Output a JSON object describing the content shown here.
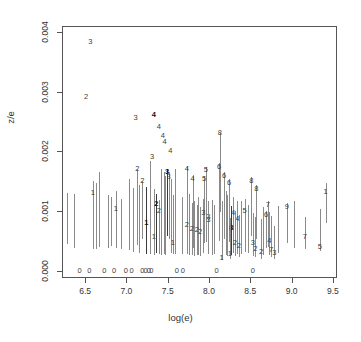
{
  "chart_data": {
    "type": "scatter",
    "title": "",
    "xlabel": "log(e)",
    "ylabel": "z/e",
    "xlim": [
      6.22,
      9.55
    ],
    "ylim": [
      -0.00012,
      0.0041
    ],
    "grid": false,
    "legend": null,
    "xticks": [
      "6.5",
      "7.0",
      "7.5",
      "8.0",
      "8.5",
      "9.0",
      "9.5"
    ],
    "xtick_values": [
      6.5,
      7.0,
      7.5,
      8.0,
      8.5,
      9.0,
      9.5
    ],
    "yticks": [
      "0.000",
      "0.001",
      "0.002",
      "0.003",
      "0.004"
    ],
    "ytick_values": [
      0.0,
      0.001,
      0.002,
      0.003,
      0.004
    ],
    "marker_style": "digit-label-with-vertical-errorbar",
    "points": [
      {
        "x": 6.55,
        "y": 0.00385,
        "label": "3",
        "bold": false,
        "err": null
      },
      {
        "x": 6.5,
        "y": 0.00292,
        "label": "2",
        "bold": false,
        "err": null
      },
      {
        "x": 7.1,
        "y": 0.00258,
        "label": "3",
        "bold": false,
        "err": null
      },
      {
        "x": 7.32,
        "y": 0.00262,
        "label": "4",
        "bold": true,
        "err": null
      },
      {
        "x": 7.38,
        "y": 0.00243,
        "label": "4",
        "bold": false,
        "err": null
      },
      {
        "x": 7.43,
        "y": 0.00228,
        "label": "4",
        "bold": false,
        "err": null
      },
      {
        "x": 7.45,
        "y": 0.00218,
        "label": "4",
        "bold": false,
        "err": null
      },
      {
        "x": 7.52,
        "y": 0.00203,
        "label": "4",
        "bold": false,
        "err": null
      },
      {
        "x": 7.3,
        "y": 0.00192,
        "label": "3",
        "bold": false,
        "err": null
      },
      {
        "x": 8.12,
        "y": 0.00232,
        "label": "8",
        "bold": false,
        "err": [
          0.001,
          0.00232
        ]
      },
      {
        "x": 7.12,
        "y": 0.00172,
        "label": "2",
        "bold": false,
        "err": [
          0.00045,
          0.00172
        ]
      },
      {
        "x": 7.18,
        "y": 0.00152,
        "label": "2",
        "bold": false,
        "err": [
          0.00055,
          0.00152
        ]
      },
      {
        "x": 7.48,
        "y": 0.00168,
        "label": "3",
        "bold": true,
        "err": [
          0.0006,
          0.00172
        ]
      },
      {
        "x": 7.5,
        "y": 0.00158,
        "label": "3",
        "bold": false,
        "err": [
          0.00055,
          0.00168
        ]
      },
      {
        "x": 7.72,
        "y": 0.00172,
        "label": "4",
        "bold": false,
        "err": [
          0.00032,
          0.00178
        ]
      },
      {
        "x": 7.79,
        "y": 0.00155,
        "label": "4",
        "bold": false,
        "err": [
          0.0004,
          0.00162
        ]
      },
      {
        "x": 7.95,
        "y": 0.0017,
        "label": "5",
        "bold": false,
        "err": [
          0.0005,
          0.00176
        ]
      },
      {
        "x": 7.93,
        "y": 0.00155,
        "label": "5",
        "bold": false,
        "err": [
          0.00048,
          0.0016
        ]
      },
      {
        "x": 8.11,
        "y": 0.00176,
        "label": "6",
        "bold": false,
        "err": [
          0.00052,
          0.00182
        ]
      },
      {
        "x": 8.17,
        "y": 0.0016,
        "label": "6",
        "bold": false,
        "err": [
          0.00055,
          0.00168
        ]
      },
      {
        "x": 8.23,
        "y": 0.00148,
        "label": "6",
        "bold": false,
        "err": [
          0.0005,
          0.00155
        ]
      },
      {
        "x": 8.5,
        "y": 0.00152,
        "label": "8",
        "bold": false,
        "err": [
          0.0006,
          0.00158
        ]
      },
      {
        "x": 8.56,
        "y": 0.00138,
        "label": "8",
        "bold": false,
        "err": [
          0.00055,
          0.00145
        ]
      },
      {
        "x": 8.7,
        "y": 0.00112,
        "label": "7",
        "bold": false,
        "err": [
          0.00042,
          0.00118
        ]
      },
      {
        "x": 8.68,
        "y": 0.00096,
        "label": "6",
        "bold": false,
        "err": [
          0.0004,
          0.00102
        ]
      },
      {
        "x": 8.93,
        "y": 0.00108,
        "label": "9",
        "bold": false,
        "err": [
          0.00048,
          0.00115
        ]
      },
      {
        "x": 9.15,
        "y": 0.00058,
        "label": "7",
        "bold": false,
        "err": [
          0.00038,
          0.00092
        ]
      },
      {
        "x": 9.4,
        "y": 0.00133,
        "label": "1",
        "bold": false,
        "err": [
          0.00082,
          0.00148
        ]
      },
      {
        "x": 9.33,
        "y": 0.00042,
        "label": "5",
        "bold": false,
        "err": [
          0.00035,
          0.00105
        ]
      },
      {
        "x": 6.86,
        "y": 0.00105,
        "label": "1",
        "bold": false,
        "err": [
          0.0004,
          0.00135
        ]
      },
      {
        "x": 6.58,
        "y": 0.00132,
        "label": "1",
        "bold": false,
        "err": [
          0.00038,
          0.00152
        ]
      },
      {
        "x": 7.23,
        "y": 0.00082,
        "label": "1",
        "bold": true,
        "err": [
          0.0003,
          0.00142
        ]
      },
      {
        "x": 7.32,
        "y": 0.00058,
        "label": "1",
        "bold": false,
        "err": [
          0.00028,
          0.00138
        ]
      },
      {
        "x": 7.55,
        "y": 0.00048,
        "label": "1",
        "bold": false,
        "err": [
          0.0003,
          0.00128
        ]
      },
      {
        "x": 7.35,
        "y": 0.00114,
        "label": "2",
        "bold": true,
        "err": [
          0.00032,
          0.0013
        ]
      },
      {
        "x": 7.38,
        "y": 0.00102,
        "label": "2",
        "bold": false,
        "err": [
          0.0003,
          0.0012
        ]
      },
      {
        "x": 7.72,
        "y": 0.00078,
        "label": "2",
        "bold": false,
        "err": [
          0.0003,
          0.0012
        ]
      },
      {
        "x": 7.78,
        "y": 0.00072,
        "label": "2",
        "bold": false,
        "err": [
          0.00028,
          0.00115
        ]
      },
      {
        "x": 7.84,
        "y": 0.0007,
        "label": "2",
        "bold": false,
        "err": [
          0.00028,
          0.00112
        ]
      },
      {
        "x": 7.88,
        "y": 0.00066,
        "label": "2",
        "bold": false,
        "err": [
          0.00026,
          0.00108
        ]
      },
      {
        "x": 7.92,
        "y": 0.00098,
        "label": "3",
        "bold": false,
        "err": [
          0.00032,
          0.00122
        ]
      },
      {
        "x": 7.98,
        "y": 0.00092,
        "label": "3",
        "bold": false,
        "err": [
          0.0003,
          0.00118
        ]
      },
      {
        "x": 8.28,
        "y": 0.00098,
        "label": "4",
        "bold": false,
        "err": [
          0.00032,
          0.00125
        ]
      },
      {
        "x": 8.33,
        "y": 0.00088,
        "label": "4",
        "bold": false,
        "err": [
          0.0003,
          0.00118
        ]
      },
      {
        "x": 8.42,
        "y": 0.00102,
        "label": "5",
        "bold": false,
        "err": [
          0.00034,
          0.00122
        ]
      },
      {
        "x": 8.26,
        "y": 0.00074,
        "label": "8",
        "bold": true,
        "err": [
          0.00028,
          0.0011
        ]
      },
      {
        "x": 8.3,
        "y": 0.00048,
        "label": "2",
        "bold": false,
        "err": [
          0.00026,
          0.00102
        ]
      },
      {
        "x": 8.35,
        "y": 0.00044,
        "label": "2",
        "bold": false,
        "err": [
          0.00024,
          0.00096
        ]
      },
      {
        "x": 8.24,
        "y": 0.0003,
        "label": "1",
        "bold": false,
        "err": [
          0.00022,
          0.0009
        ]
      },
      {
        "x": 8.52,
        "y": 0.00048,
        "label": "3",
        "bold": false,
        "err": [
          0.00026,
          0.00098
        ]
      },
      {
        "x": 8.55,
        "y": 0.00038,
        "label": "2",
        "bold": false,
        "err": [
          0.00024,
          0.00092
        ]
      },
      {
        "x": 8.62,
        "y": 0.00034,
        "label": "2",
        "bold": false,
        "err": [
          0.00022,
          0.00088
        ]
      },
      {
        "x": 8.72,
        "y": 0.00052,
        "label": "4",
        "bold": false,
        "err": [
          0.00028,
          0.001
        ]
      },
      {
        "x": 8.74,
        "y": 0.00036,
        "label": "7",
        "bold": false,
        "err": [
          0.00024,
          0.00094
        ]
      },
      {
        "x": 8.78,
        "y": 0.00032,
        "label": "3",
        "bold": false,
        "err": [
          0.00022,
          0.00076
        ]
      },
      {
        "x": 8.14,
        "y": 0.00024,
        "label": "1",
        "bold": false,
        "err": [
          0.0002,
          0.00118
        ]
      },
      {
        "x": 7.98,
        "y": 0.00086,
        "label": "3",
        "bold": false,
        "err": [
          0.0003,
          0.0011
        ]
      }
    ],
    "baseline_zero_labels": [
      {
        "x": 6.42,
        "label": "0"
      },
      {
        "x": 6.54,
        "label": "0"
      },
      {
        "x": 6.72,
        "label": "0"
      },
      {
        "x": 6.84,
        "label": "0"
      },
      {
        "x": 6.98,
        "label": "0"
      },
      {
        "x": 7.05,
        "label": "0"
      },
      {
        "x": 7.18,
        "label": "0"
      },
      {
        "x": 7.22,
        "label": "0"
      },
      {
        "x": 7.26,
        "label": "0"
      },
      {
        "x": 7.29,
        "label": "0"
      },
      {
        "x": 7.6,
        "label": "0"
      },
      {
        "x": 7.67,
        "label": "0"
      },
      {
        "x": 8.08,
        "label": "0"
      },
      {
        "x": 8.52,
        "label": "0"
      }
    ],
    "bare_errorbars": [
      {
        "x": 6.27,
        "lo": 0.00046,
        "hi": 0.00132
      },
      {
        "x": 6.35,
        "lo": 0.0004,
        "hi": 0.0013
      },
      {
        "x": 6.62,
        "lo": 0.00038,
        "hi": 0.00148
      },
      {
        "x": 6.66,
        "lo": 0.00042,
        "hi": 0.00168
      },
      {
        "x": 6.76,
        "lo": 0.0004,
        "hi": 0.00128
      },
      {
        "x": 6.8,
        "lo": 0.00044,
        "hi": 0.00125
      },
      {
        "x": 6.92,
        "lo": 0.00038,
        "hi": 0.00122
      },
      {
        "x": 7.02,
        "lo": 0.00036,
        "hi": 0.00155
      },
      {
        "x": 7.07,
        "lo": 0.00034,
        "hi": 0.0014
      },
      {
        "x": 7.14,
        "lo": 0.00032,
        "hi": 0.00145
      },
      {
        "x": 7.27,
        "lo": 0.0003,
        "hi": 0.00185
      },
      {
        "x": 7.41,
        "lo": 0.00028,
        "hi": 0.00172
      },
      {
        "x": 7.44,
        "lo": 0.0003,
        "hi": 0.00168
      },
      {
        "x": 7.46,
        "lo": 0.00028,
        "hi": 0.0016
      },
      {
        "x": 7.53,
        "lo": 0.00032,
        "hi": 0.00155
      },
      {
        "x": 7.58,
        "lo": 0.0003,
        "hi": 0.00172
      },
      {
        "x": 7.66,
        "lo": 0.0003,
        "hi": 0.00125
      },
      {
        "x": 7.75,
        "lo": 0.00028,
        "hi": 0.0013
      },
      {
        "x": 7.81,
        "lo": 0.00026,
        "hi": 0.00118
      },
      {
        "x": 7.86,
        "lo": 0.00028,
        "hi": 0.00125
      },
      {
        "x": 8.02,
        "lo": 0.00028,
        "hi": 0.0012
      },
      {
        "x": 8.05,
        "lo": 0.0003,
        "hi": 0.00112
      },
      {
        "x": 8.19,
        "lo": 0.00028,
        "hi": 0.00135
      },
      {
        "x": 8.21,
        "lo": 0.00026,
        "hi": 0.00128
      },
      {
        "x": 8.38,
        "lo": 0.0003,
        "hi": 0.00118
      },
      {
        "x": 8.46,
        "lo": 0.00032,
        "hi": 0.00112
      },
      {
        "x": 8.64,
        "lo": 0.00028,
        "hi": 0.00108
      },
      {
        "x": 8.82,
        "lo": 0.00032,
        "hi": 0.0011
      },
      {
        "x": 9.02,
        "lo": 0.0004,
        "hi": 0.00118
      }
    ]
  }
}
